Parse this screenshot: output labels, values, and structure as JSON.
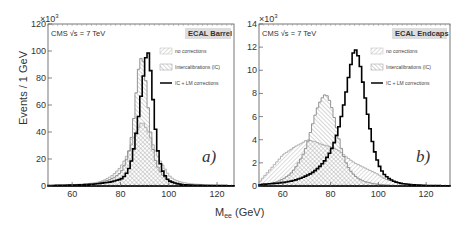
{
  "figure": {
    "ylabel": "Events / 1 GeV",
    "xlabel_main": "M",
    "xlabel_sub": "ee",
    "xlabel_unit": " (GeV)",
    "multiplier": "×10",
    "multiplier_exp": "3"
  },
  "chart_data": [
    {
      "type": "line",
      "title": "ECAL Barrel",
      "annotation": "CMS  √s = 7 TeV",
      "panel_label": "a)",
      "xlabel": "M_ee (GeV)",
      "ylabel": "Events / 1 GeV",
      "y_multiplier": "×10^3",
      "xlim": [
        50,
        127
      ],
      "ylim": [
        0,
        120
      ],
      "xticks": [
        60,
        80,
        100,
        120
      ],
      "yticks": [
        0,
        20,
        40,
        60,
        80,
        100,
        120
      ],
      "legend": [
        "no corrections",
        "Intercalibrations (IC)",
        "IC + LM corrections"
      ],
      "x": [
        50,
        60,
        65,
        70,
        72,
        74,
        76,
        78,
        80,
        81,
        82,
        83,
        84,
        85,
        86,
        87,
        88,
        89,
        90,
        91,
        92,
        93,
        94,
        95,
        96,
        97,
        98,
        99,
        100,
        102,
        104,
        106,
        110,
        115,
        120,
        127
      ],
      "series": [
        {
          "name": "no corrections",
          "values": [
            0.3,
            1,
            1.5,
            2.5,
            3.5,
            5,
            7,
            10,
            14,
            17,
            20,
            24,
            28,
            33,
            38,
            42,
            45,
            48,
            45,
            42,
            38,
            33,
            28,
            24,
            20,
            17,
            14,
            11,
            8,
            5,
            3.5,
            2.5,
            1.5,
            1,
            0.5,
            0.3
          ]
        },
        {
          "name": "Intercalibrations (IC)",
          "values": [
            0.3,
            0.8,
            1.2,
            2,
            2.8,
            3.8,
            5,
            7,
            10,
            13,
            17,
            22,
            30,
            42,
            58,
            80,
            93,
            96,
            88,
            68,
            48,
            32,
            22,
            16,
            12,
            9,
            7,
            5,
            4,
            2.5,
            1.5,
            1,
            0.7,
            0.4,
            0.3,
            0.2
          ]
        },
        {
          "name": "IC + LM corrections",
          "values": [
            0.3,
            0.7,
            1,
            1.5,
            2,
            2.5,
            3,
            4,
            5,
            6,
            8,
            11,
            15,
            22,
            33,
            45,
            58,
            75,
            88,
            102,
            95,
            76,
            52,
            32,
            20,
            13,
            9,
            6,
            4,
            2.5,
            1.5,
            1,
            0.6,
            0.4,
            0.3,
            0.2
          ]
        }
      ]
    },
    {
      "type": "line",
      "title": "ECAL Endcaps",
      "annotation": "CMS  √s = 7 TeV",
      "panel_label": "b)",
      "xlabel": "M_ee (GeV)",
      "ylabel": "Events / 1 GeV",
      "y_multiplier": "×10^3",
      "xlim": [
        50,
        130
      ],
      "ylim": [
        0,
        14
      ],
      "xticks": [
        60,
        80,
        100,
        120
      ],
      "yticks": [
        0,
        2,
        4,
        6,
        8,
        10,
        12,
        14
      ],
      "legend": [
        "no corrections",
        "Intercalibrations (IC)",
        "IC + LM corrections"
      ],
      "x": [
        50,
        52,
        55,
        58,
        60,
        63,
        65,
        68,
        70,
        72,
        74,
        76,
        78,
        80,
        82,
        84,
        86,
        88,
        90,
        92,
        94,
        96,
        98,
        100,
        102,
        104,
        106,
        108,
        110,
        115,
        120,
        125,
        130
      ],
      "series": [
        {
          "name": "no corrections",
          "values": [
            0.3,
            0.8,
            1.5,
            2.2,
            2.7,
            3.1,
            3.4,
            3.7,
            4.0,
            3.9,
            3.8,
            3.6,
            3.5,
            3.4,
            3.2,
            3.0,
            2.6,
            2.3,
            2.0,
            1.8,
            1.6,
            1.4,
            1.2,
            1.0,
            0.7,
            0.5,
            0.4,
            0.3,
            0.2,
            0.1,
            0.05,
            0.02,
            0.01
          ]
        },
        {
          "name": "Intercalibrations (IC)",
          "values": [
            0.05,
            0.1,
            0.2,
            0.4,
            0.6,
            1.0,
            1.5,
            2.5,
            3.5,
            5.0,
            6.5,
            7.5,
            8.0,
            7.2,
            5.5,
            3.6,
            2.2,
            1.4,
            0.9,
            0.6,
            0.4,
            0.3,
            0.2,
            0.15,
            0.1,
            0.08,
            0.05,
            0.04,
            0.03,
            0.02,
            0.01,
            0.01,
            0.0
          ]
        },
        {
          "name": "IC + LM corrections",
          "values": [
            0.1,
            0.15,
            0.2,
            0.25,
            0.3,
            0.4,
            0.5,
            0.7,
            0.9,
            1.1,
            1.4,
            1.8,
            2.3,
            3.0,
            4.0,
            5.5,
            7.5,
            10.0,
            12.0,
            11.0,
            8.3,
            5.5,
            3.3,
            1.9,
            1.1,
            0.7,
            0.45,
            0.3,
            0.2,
            0.1,
            0.05,
            0.03,
            0.02
          ]
        }
      ]
    }
  ]
}
